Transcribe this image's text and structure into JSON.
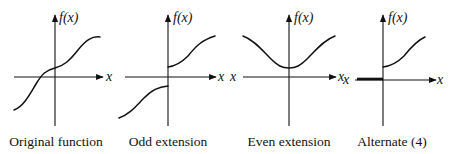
{
  "figure": {
    "panels": [
      {
        "id": "original",
        "caption": "Original function",
        "y_label": "f(x)",
        "x_label_right": "x",
        "x_label_left": ""
      },
      {
        "id": "odd",
        "caption": "Odd extension",
        "y_label": "f(x)",
        "x_label_right": "x",
        "x_label_left": "x"
      },
      {
        "id": "even",
        "caption": "Even extension",
        "y_label": "f(x)",
        "x_label_right": "x",
        "x_label_left": "x"
      },
      {
        "id": "alternate",
        "caption": "Alternate (4)",
        "y_label": "f(x)",
        "x_label_right": "x",
        "x_label_left": "x"
      }
    ],
    "colors": {
      "ink": "#111111",
      "background": "#ffffff"
    }
  }
}
